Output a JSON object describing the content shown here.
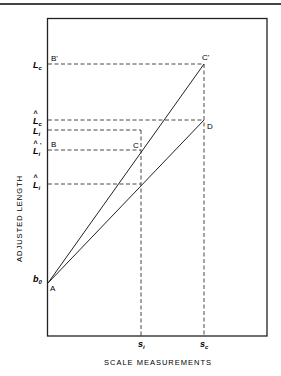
{
  "diagram": {
    "x_axis_title": "SCALE MEASUREMENTS",
    "y_axis_title": "ADJUSTED LENGTH",
    "y_labels": [
      {
        "id": "Lc",
        "text": "L",
        "sub": "c",
        "hat": false,
        "prime": false
      },
      {
        "id": "Lc_hat",
        "text": "L",
        "sub": "c",
        "hat": true,
        "prime": false
      },
      {
        "id": "Li",
        "text": "L",
        "sub": "i",
        "hat": false,
        "prime": false
      },
      {
        "id": "Li_hat_prime",
        "text": "L",
        "sub": "i",
        "hat": true,
        "prime": true
      },
      {
        "id": "Li_hat",
        "text": "L",
        "sub": "i",
        "hat": true,
        "prime": false
      },
      {
        "id": "b0",
        "text": "b",
        "sub": "0",
        "hat": false,
        "prime": false
      }
    ],
    "x_labels": [
      {
        "id": "si",
        "text": "s",
        "sub": "i"
      },
      {
        "id": "sc",
        "text": "s",
        "sub": "c"
      }
    ],
    "points": {
      "A": "A",
      "B": "B",
      "B_prime": "B'",
      "C": "C",
      "C_prime": "C'",
      "D": "D"
    }
  }
}
